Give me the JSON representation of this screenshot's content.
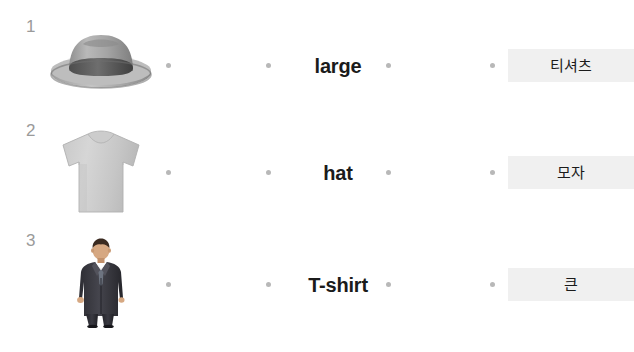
{
  "worksheet": {
    "type": "matching-exercise",
    "background_color": "#ffffff",
    "answer_box_color": "#f0f0f0",
    "dot_color": "#b8b8b8",
    "number_color": "#9a9a9a",
    "rows": [
      {
        "number": "1",
        "image": "gray-fedora-hat-photo",
        "image_alt": "hat",
        "english": "large",
        "korean": "티셔츠"
      },
      {
        "number": "2",
        "image": "light-gray-tshirt-photo",
        "image_alt": "T-shirt",
        "english": "hat",
        "korean": "모자"
      },
      {
        "number": "3",
        "image": "man-in-dark-suit-photo",
        "image_alt": "man wearing large coat",
        "english": "T-shirt",
        "korean": "큰"
      }
    ]
  }
}
